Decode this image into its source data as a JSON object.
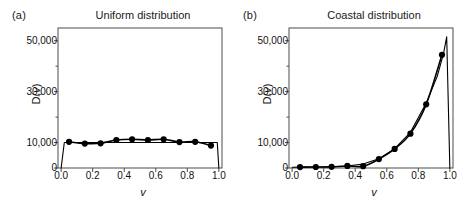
{
  "figure": {
    "width": 462,
    "height": 209,
    "background": "#ffffff",
    "line_color": "#000000",
    "marker_color": "#000000",
    "frame_color": "#4d4d4d"
  },
  "panels": [
    {
      "label": "(a)",
      "title": "Uniform distribution"
    },
    {
      "label": "(b)",
      "title": "Coastal distribution"
    }
  ],
  "axis": {
    "xlabel": "v",
    "ylabel_prefix": "D(",
    "ylabel_var": "v",
    "ylabel_suffix": ")",
    "ytick_labels": [
      "0",
      "10,000",
      "30,000",
      "50,000"
    ],
    "ytick_values": [
      0,
      10000,
      30000,
      50000
    ],
    "yminor_values": [
      20000,
      40000
    ],
    "xtick_labels": [
      "0.0",
      "0.2",
      "0.4",
      "0.6",
      "0.8",
      "1.0"
    ],
    "xtick_values": [
      0.0,
      0.2,
      0.4,
      0.6,
      0.8,
      1.0
    ],
    "xlim": [
      -0.02,
      1.02
    ],
    "ylim": [
      0,
      55000
    ]
  },
  "chart_data": [
    {
      "type": "line",
      "title": "Uniform distribution",
      "panel": "(a)",
      "xlabel": "v",
      "ylabel": "D(v)",
      "xlim": [
        -0.02,
        1.02
      ],
      "ylim": [
        0,
        55000
      ],
      "grid": false,
      "legend": "none",
      "series": [
        {
          "name": "binned counts (markers)",
          "marker": "filled-circle",
          "x": [
            0.05,
            0.15,
            0.25,
            0.35,
            0.45,
            0.55,
            0.65,
            0.75,
            0.85,
            0.95
          ],
          "values": [
            10300,
            9600,
            9700,
            11000,
            11300,
            11000,
            11300,
            10200,
            10300,
            8800
          ]
        },
        {
          "name": "theoretical curve",
          "marker": "none",
          "x": [
            0.0,
            0.02,
            0.05,
            0.15,
            0.25,
            0.35,
            0.45,
            0.55,
            0.65,
            0.75,
            0.85,
            0.95,
            0.99,
            1.0
          ],
          "values": [
            0,
            10000,
            10000,
            10000,
            10000,
            10000,
            10000,
            10000,
            10000,
            10000,
            10000,
            10000,
            10000,
            0
          ]
        }
      ]
    },
    {
      "type": "line",
      "title": "Coastal distribution",
      "panel": "(b)",
      "xlabel": "v",
      "ylabel": "D(v)",
      "xlim": [
        -0.02,
        1.02
      ],
      "ylim": [
        0,
        55000
      ],
      "grid": false,
      "legend": "none",
      "series": [
        {
          "name": "binned counts (markers)",
          "marker": "filled-circle",
          "x": [
            0.05,
            0.15,
            0.25,
            0.35,
            0.45,
            0.55,
            0.65,
            0.75,
            0.85,
            0.95
          ],
          "values": [
            350,
            400,
            450,
            800,
            700,
            3500,
            7500,
            13500,
            25000,
            44500
          ]
        },
        {
          "name": "theoretical curve",
          "marker": "none",
          "x": [
            0.0,
            0.05,
            0.15,
            0.25,
            0.35,
            0.45,
            0.55,
            0.65,
            0.75,
            0.85,
            0.92,
            0.96,
            0.98,
            1.0
          ],
          "values": [
            300,
            350,
            400,
            500,
            800,
            1600,
            3600,
            7600,
            14000,
            25500,
            36000,
            45000,
            51500,
            0
          ]
        }
      ]
    }
  ]
}
